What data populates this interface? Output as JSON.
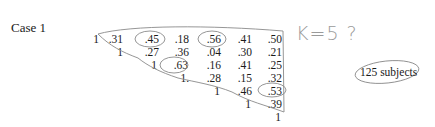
{
  "title": "Case 1",
  "matrix": {
    "rows": [
      [
        "1",
        ".31",
        ".45",
        ".18",
        ".56",
        ".41",
        ".50"
      ],
      [
        "1",
        ".27",
        ".36",
        ".04",
        ".30",
        ".21"
      ],
      [
        "1",
        ".63",
        ".16",
        ".41",
        ".25"
      ],
      [
        "1.",
        ".28",
        ".15",
        ".32"
      ],
      [
        "1",
        ".46",
        ".53"
      ],
      [
        "1",
        ".39"
      ],
      [
        "1"
      ]
    ],
    "circled_values": [
      ".45",
      ".56",
      ".63",
      ".53"
    ]
  },
  "annotations": {
    "handwritten_note": "K=5 ?",
    "subjects_label": "125 subjects"
  }
}
